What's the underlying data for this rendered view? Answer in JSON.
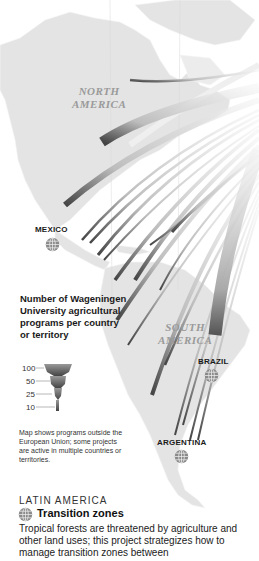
{
  "map": {
    "regions": {
      "north_america": [
        "NORTH",
        "AMERICA"
      ],
      "south_america": [
        "SOUTH",
        "AMERICA"
      ]
    },
    "countries": [
      {
        "name": "MEXICO"
      },
      {
        "name": "BRAZIL"
      },
      {
        "name": "ARGENTINA"
      }
    ],
    "colors": {
      "land": "#e4e4e4",
      "arc_dark": "#4a4a4a",
      "arc_light": "#efefef",
      "background": "#ffffff"
    }
  },
  "legend": {
    "title": "Number of Wageningen University agricultural programs per country or territory",
    "scale": [
      {
        "value": "100"
      },
      {
        "value": "50"
      },
      {
        "value": "25"
      },
      {
        "value": "10"
      }
    ],
    "note": "Map shows programs outside the European Union; some projects are active in multiple countries or territories."
  },
  "project": {
    "region": "LATIN AMERICA",
    "icon": "globe-icon",
    "title": "Transition zones",
    "body": "Tropical forests are threatened by agriculture and other land uses; this project strategizes how to manage transition zones between"
  }
}
